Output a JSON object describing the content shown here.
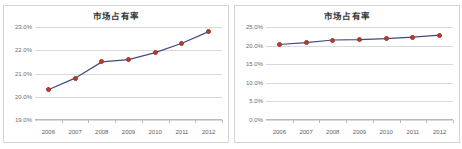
{
  "page": {
    "background_color": "#ffffff",
    "layout": "two-charts-side-by-side"
  },
  "charts": [
    {
      "id": "left",
      "title": "市场占有率",
      "axis_note": "zoomed y-axis 19.0% to 23.0%",
      "y_ticks": [
        "23.0%",
        "22.0%",
        "21.0%",
        "20.0%",
        "19.0%"
      ],
      "x_ticks": [
        "2006",
        "2007",
        "2008",
        "2009",
        "2010",
        "2011",
        "2012"
      ]
    },
    {
      "id": "right",
      "title": "市场占有率",
      "axis_note": "full y-axis 0.0% to 25.0%",
      "y_ticks": [
        "25.0%",
        "20.0%",
        "15.0%",
        "10.0%",
        "5.0%",
        "0.0%"
      ],
      "x_ticks": [
        "2006",
        "2007",
        "2008",
        "2009",
        "2010",
        "2011",
        "2012"
      ]
    }
  ],
  "colors": {
    "marker": "#c0392b",
    "line": "#3f4a7e",
    "gridline": "#d9d9d9",
    "axis": "#b8b8b8",
    "frame_border": "#d4d4d4",
    "title_text": "#3a3a3a",
    "tick_text": "#6b6b6b"
  },
  "chart_data": [
    {
      "type": "line",
      "title": "市场占有率",
      "xlabel": "",
      "ylabel": "",
      "categories": [
        "2006",
        "2007",
        "2008",
        "2009",
        "2010",
        "2011",
        "2012"
      ],
      "x_tick_labels": [
        "2006",
        "2007",
        "2008",
        "2009",
        "2010",
        "2011",
        "2012"
      ],
      "y_tick_labels": [
        "19.0%",
        "20.0%",
        "21.0%",
        "22.0%",
        "23.0%"
      ],
      "y_tick_values": [
        19.0,
        20.0,
        21.0,
        22.0,
        23.0
      ],
      "ylim": [
        19.0,
        23.0
      ],
      "values": [
        20.3,
        20.8,
        21.5,
        21.6,
        21.9,
        22.3,
        22.8
      ],
      "series": [
        {
          "name": "市场占有率",
          "values": [
            20.3,
            20.8,
            21.5,
            21.6,
            21.9,
            22.3,
            22.8
          ],
          "line_color": "#3f4a7e",
          "marker_color": "#c0392b"
        }
      ],
      "grid": true,
      "legend": false,
      "legend_position": "none"
    },
    {
      "type": "line",
      "title": "市场占有率",
      "xlabel": "",
      "ylabel": "",
      "categories": [
        "2006",
        "2007",
        "2008",
        "2009",
        "2010",
        "2011",
        "2012"
      ],
      "x_tick_labels": [
        "2006",
        "2007",
        "2008",
        "2009",
        "2010",
        "2011",
        "2012"
      ],
      "y_tick_labels": [
        "0.0%",
        "5.0%",
        "10.0%",
        "15.0%",
        "20.0%",
        "25.0%"
      ],
      "y_tick_values": [
        0.0,
        5.0,
        10.0,
        15.0,
        20.0,
        25.0
      ],
      "ylim": [
        0.0,
        25.0
      ],
      "values": [
        20.3,
        20.8,
        21.5,
        21.6,
        21.9,
        22.3,
        22.8
      ],
      "series": [
        {
          "name": "市场占有率",
          "values": [
            20.3,
            20.8,
            21.5,
            21.6,
            21.9,
            22.3,
            22.8
          ],
          "line_color": "#3f4a7e",
          "marker_color": "#c0392b"
        }
      ],
      "grid": true,
      "legend": false,
      "legend_position": "none"
    }
  ]
}
